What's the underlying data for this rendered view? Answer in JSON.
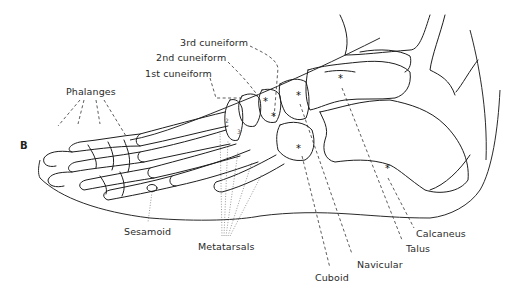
{
  "figure": {
    "panel_letter": "B",
    "labels": {
      "phalanges": "Phalanges",
      "first_cuneiform": "1st cuneiform",
      "second_cuneiform": "2nd cuneiform",
      "third_cuneiform": "3rd cuneiform",
      "sesamoid": "Sesamoid",
      "metatarsals": "Metatarsals",
      "cuboid": "Cuboid",
      "navicular": "Navicular",
      "talus": "Talus",
      "calcaneus": "Calcaneus"
    },
    "metatarsal_numbers": [
      "1",
      "2",
      "3",
      "4",
      "5"
    ],
    "marker_symbol": "*",
    "colors": {
      "line": "#1e1e1e",
      "background": "#ffffff"
    }
  }
}
